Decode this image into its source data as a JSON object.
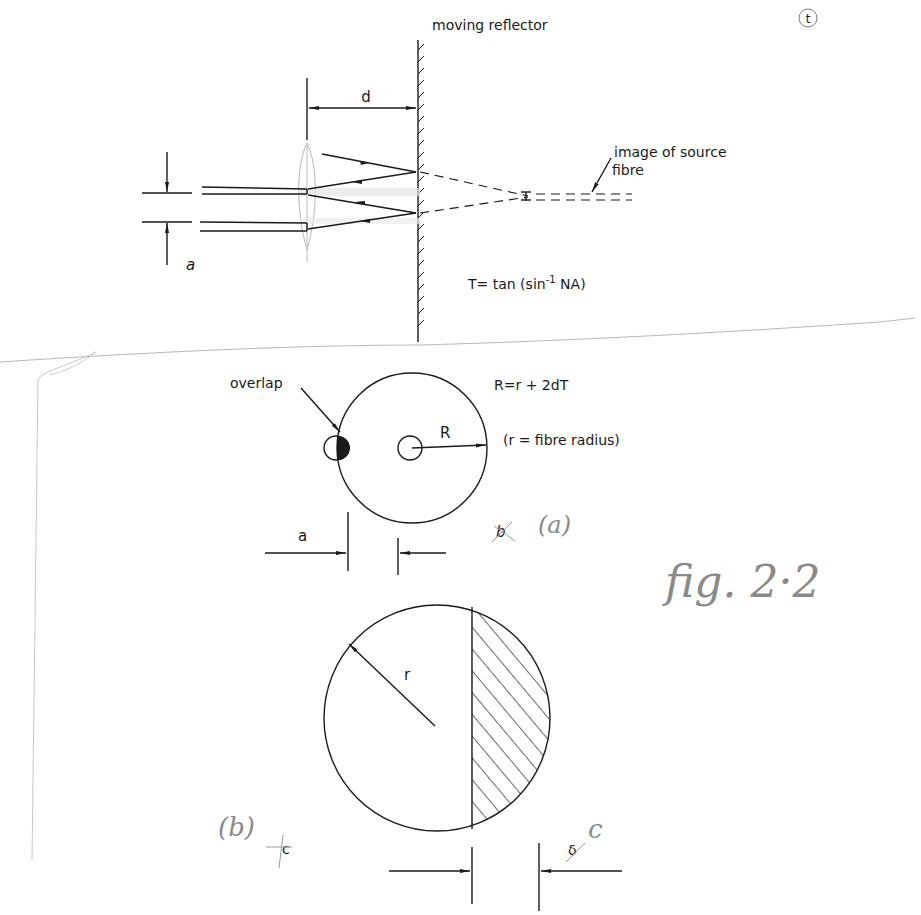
{
  "figure": {
    "page_mark": "t",
    "handwritten_title": "fig. 2·2"
  },
  "top_panel": {
    "reflector_label": "moving reflector",
    "distance_label": "d",
    "separation_label": "a",
    "image_label_line1": "image of source",
    "image_label_line2": "fibre",
    "formula_T": "T= tan (sin",
    "formula_T_sup": "-1",
    "formula_T_end": " NA)"
  },
  "panel_a": {
    "overlap_label": "overlap",
    "R_formula": "R=r + 2dT",
    "R_label": "R",
    "r_note": "(r = fibre radius)",
    "separation_label": "a",
    "struck_label": "b",
    "panel_label": "(a)"
  },
  "panel_b": {
    "radius_label": "r",
    "panel_label": "(b)",
    "struck_c_label": "c",
    "struck_delta_label": "δ",
    "replacement_label": "c"
  },
  "colors": {
    "ink": "#1a1a1a",
    "pencil": "#8a8a8a",
    "faint_pencil": "#b8b8b8",
    "paper": "#ffffff"
  }
}
